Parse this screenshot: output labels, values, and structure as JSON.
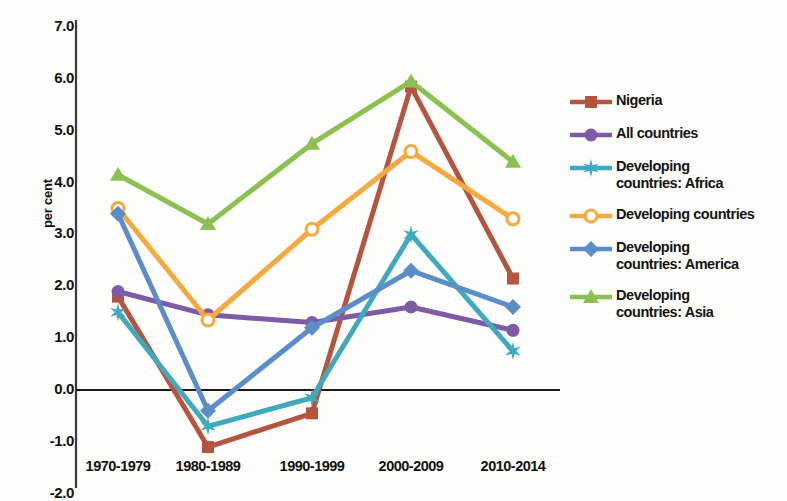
{
  "chart_data": {
    "type": "line",
    "title": "",
    "xlabel": "",
    "ylabel": "per cent",
    "categories": [
      "1970-1979",
      "1980-1989",
      "1990-1999",
      "2000-2009",
      "2010-2014"
    ],
    "ylim": [
      -2.0,
      7.0
    ],
    "ytick_labels": [
      "7.0",
      "6.0",
      "5.0",
      "4.0",
      "3.0",
      "2.0",
      "1.0",
      "0.0",
      "-1.0",
      "-2.0"
    ],
    "ytick_values": [
      7.0,
      6.0,
      5.0,
      4.0,
      3.0,
      2.0,
      1.0,
      0.0,
      -1.0,
      -2.0
    ],
    "grid": false,
    "zero_line": true,
    "legend_position": "right",
    "series": [
      {
        "name": "Nigeria",
        "label": "Nigeria",
        "color": "#b5553f",
        "marker": "square",
        "values": [
          1.8,
          -1.1,
          -0.45,
          5.85,
          2.15
        ]
      },
      {
        "name": "All countries",
        "label": "All countries",
        "color": "#7d5ba6",
        "marker": "circle",
        "values": [
          1.9,
          1.45,
          1.3,
          1.6,
          1.15
        ]
      },
      {
        "name": "Developing countries: Africa",
        "label": "Developing\ncountries: Africa",
        "color": "#3fa9bd",
        "marker": "star",
        "values": [
          1.5,
          -0.7,
          -0.15,
          3.0,
          0.75
        ]
      },
      {
        "name": "Developing countries",
        "label": "Developing countries",
        "color": "#f5a93f",
        "marker": "circle-open",
        "values": [
          3.5,
          1.35,
          3.1,
          4.6,
          3.3
        ]
      },
      {
        "name": "Developing countries: America",
        "label": "Developing\ncountries: America",
        "color": "#5b8dc8",
        "marker": "diamond",
        "values": [
          3.4,
          -0.4,
          1.2,
          2.3,
          1.6
        ]
      },
      {
        "name": "Developing countries: Asia",
        "label": "Developing\ncountries: Asia",
        "color": "#8cc152",
        "marker": "triangle",
        "values": [
          4.15,
          3.2,
          4.75,
          5.95,
          4.4
        ]
      }
    ]
  }
}
